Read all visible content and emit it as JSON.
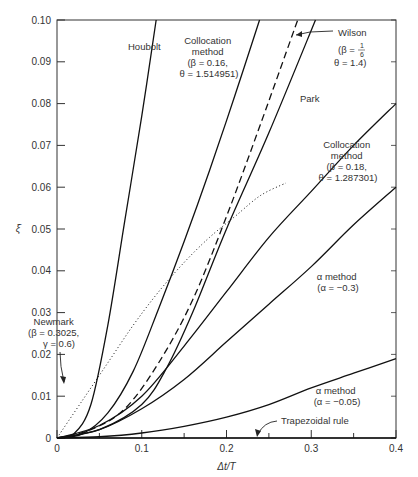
{
  "chart_data": {
    "type": "line",
    "title": "",
    "xlabel": "Δt/T",
    "ylabel": "ξ̄",
    "xlim": [
      0,
      0.4
    ],
    "ylim": [
      0,
      0.1
    ],
    "x_ticks": [
      "0",
      "0.1",
      "0.2",
      "0.3",
      "0.4"
    ],
    "y_ticks": [
      "0",
      "0.01",
      "0.02",
      "0.03",
      "0.04",
      "0.05",
      "0.06",
      "0.07",
      "0.08",
      "0.09",
      "0.10"
    ],
    "grid": false,
    "legend": "inline annotations",
    "series": [
      {
        "name": "Houbolt",
        "style": "solid",
        "x": [
          0,
          0.02,
          0.04,
          0.06,
          0.08,
          0.1,
          0.117
        ],
        "y": [
          0,
          0.001,
          0.008,
          0.027,
          0.052,
          0.077,
          0.1
        ]
      },
      {
        "name": "Collocation method (β = 0.16, θ = 1.514951)",
        "style": "solid",
        "x": [
          0,
          0.03,
          0.06,
          0.09,
          0.12,
          0.15,
          0.18,
          0.21,
          0.239
        ],
        "y": [
          0,
          0.001,
          0.006,
          0.016,
          0.031,
          0.047,
          0.064,
          0.082,
          0.1
        ]
      },
      {
        "name": "Wilson (β = 1/6, θ = 1.4)",
        "style": "dashed",
        "x": [
          0,
          0.04,
          0.08,
          0.12,
          0.16,
          0.2,
          0.24,
          0.284
        ],
        "y": [
          0,
          0.002,
          0.007,
          0.018,
          0.033,
          0.053,
          0.075,
          0.1
        ]
      },
      {
        "name": "Park",
        "style": "solid",
        "x": [
          0,
          0.05,
          0.1,
          0.13,
          0.16,
          0.2,
          0.25,
          0.305
        ],
        "y": [
          0,
          0.002,
          0.008,
          0.017,
          0.03,
          0.05,
          0.073,
          0.1
        ]
      },
      {
        "name": "Collocation method (β = 0.18, θ = 1.287301)",
        "style": "solid",
        "x": [
          0,
          0.05,
          0.1,
          0.15,
          0.2,
          0.25,
          0.3,
          0.35,
          0.4
        ],
        "y": [
          0,
          0.003,
          0.01,
          0.022,
          0.035,
          0.048,
          0.059,
          0.07,
          0.08
        ]
      },
      {
        "name": "α method (α = −0.3)",
        "style": "solid",
        "x": [
          0,
          0.05,
          0.1,
          0.15,
          0.2,
          0.25,
          0.3,
          0.35,
          0.4
        ],
        "y": [
          0,
          0.002,
          0.007,
          0.014,
          0.023,
          0.032,
          0.041,
          0.051,
          0.06
        ]
      },
      {
        "name": "α method (α = −0.05)",
        "style": "solid",
        "x": [
          0,
          0.05,
          0.1,
          0.15,
          0.2,
          0.25,
          0.3,
          0.35,
          0.4
        ],
        "y": [
          0,
          0.0003,
          0.0012,
          0.0028,
          0.005,
          0.008,
          0.012,
          0.0155,
          0.019
        ]
      },
      {
        "name": "Trapezoidal rule",
        "style": "solid",
        "x": [
          0,
          0.4
        ],
        "y": [
          0,
          0
        ]
      },
      {
        "name": "Newmark (β = 0.3025, γ = 0.6)",
        "style": "dotted",
        "x": [
          0,
          0.03,
          0.06,
          0.09,
          0.12,
          0.15,
          0.18,
          0.21,
          0.24,
          0.27
        ],
        "y": [
          0,
          0.009,
          0.018,
          0.027,
          0.035,
          0.042,
          0.048,
          0.053,
          0.058,
          0.061
        ]
      }
    ],
    "annotations": [
      {
        "text": "Houbolt"
      },
      {
        "text": "Collocation method (β = 0.16, θ = 1.514951)"
      },
      {
        "text": "Wilson (β = 1/6, θ = 1.4)"
      },
      {
        "text": "Park"
      },
      {
        "text": "Collocation method (β = 0.18, θ = 1.287301)"
      },
      {
        "text": "α method (α = −0.3)"
      },
      {
        "text": "Newmark (β = 0.3025, γ = 0.6)"
      },
      {
        "text": "α method (α = −0.05)"
      },
      {
        "text": "Trapezoidal rule"
      }
    ]
  },
  "labels": {
    "houbolt": "Houbolt",
    "coll1": [
      "Collocation",
      "method",
      "(β = 0.16,",
      "θ = 1.514951)"
    ],
    "wilson": [
      "Wilson",
      "(β = ",
      "θ = 1.4)"
    ],
    "wilson_frac": {
      "num": "1",
      "den": "6"
    },
    "park": "Park",
    "coll2": [
      "Collocation",
      "method",
      "(β = 0.18,",
      "θ = 1.287301)"
    ],
    "alpha1": [
      "α method",
      "(α = −0.3)"
    ],
    "newmark": [
      "Newmark",
      "(β = 0.3025,",
      "γ = 0.6)"
    ],
    "alpha2": [
      "α method",
      "(α = −0.05)"
    ],
    "trap": "Trapezoidal rule"
  }
}
